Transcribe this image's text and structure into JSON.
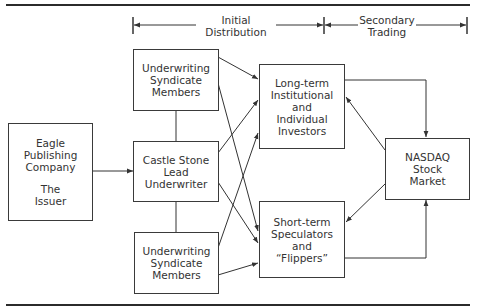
{
  "header": {
    "phases": [
      {
        "id": "initial",
        "line1": "Initial",
        "line2": "Distribution"
      },
      {
        "id": "secondary",
        "line1": "Secondary",
        "line2": "Trading"
      }
    ]
  },
  "nodes": {
    "issuer": {
      "lines": [
        "Eagle",
        "Publishing",
        "Company"
      ],
      "sub": [
        "The",
        "Issuer"
      ]
    },
    "syndicate_top": {
      "lines": [
        "Underwriting",
        "Syndicate",
        "Members"
      ]
    },
    "lead_underwriter": {
      "lines": [
        "Castle Stone",
        "Lead",
        "Underwriter"
      ]
    },
    "syndicate_bottom": {
      "lines": [
        "Underwriting",
        "Syndicate",
        "Members"
      ]
    },
    "long_term": {
      "lines": [
        "Long-term",
        "Institutional",
        "and",
        "Individual",
        "Investors"
      ]
    },
    "short_term": {
      "lines": [
        "Short-term",
        "Speculators",
        "and",
        "“Flippers”"
      ]
    },
    "nasdaq": {
      "lines": [
        "NASDAQ",
        "Stock",
        "Market"
      ]
    }
  },
  "edges": [
    {
      "from": "issuer",
      "to": "lead_underwriter",
      "arrow": true
    },
    {
      "from": "syndicate_top",
      "to": "lead_underwriter",
      "arrow": false
    },
    {
      "from": "lead_underwriter",
      "to": "syndicate_bottom",
      "arrow": false
    },
    {
      "from": "syndicate_top",
      "to": "long_term",
      "arrow": true
    },
    {
      "from": "syndicate_top",
      "to": "short_term",
      "arrow": true
    },
    {
      "from": "lead_underwriter",
      "to": "long_term",
      "arrow": true
    },
    {
      "from": "lead_underwriter",
      "to": "short_term",
      "arrow": true
    },
    {
      "from": "syndicate_bottom",
      "to": "long_term",
      "arrow": true
    },
    {
      "from": "syndicate_bottom",
      "to": "short_term",
      "arrow": true
    },
    {
      "from": "long_term",
      "to": "nasdaq",
      "arrow": true
    },
    {
      "from": "nasdaq",
      "to": "long_term",
      "arrow": true
    },
    {
      "from": "nasdaq",
      "to": "short_term",
      "arrow": true
    },
    {
      "from": "short_term",
      "to": "nasdaq",
      "arrow": true
    }
  ],
  "colors": {
    "line": "#333333",
    "background": "#ffffff"
  }
}
